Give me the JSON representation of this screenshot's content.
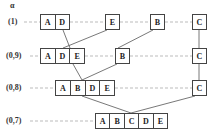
{
  "axis_label": "α",
  "levels": [
    {
      "label": "(1)",
      "groups": [
        [
          "A",
          "D"
        ],
        [
          "E"
        ],
        [
          "B"
        ],
        [
          "C"
        ]
      ]
    },
    {
      "label": "(0,9)",
      "groups": [
        [
          "A",
          "D",
          "E"
        ],
        [
          "B"
        ],
        [
          "C"
        ]
      ]
    },
    {
      "label": "(0,8)",
      "groups": [
        [
          "A",
          "B",
          "D",
          "E"
        ],
        [
          "C"
        ]
      ]
    },
    {
      "label": "(0,7)",
      "groups": [
        [
          "A",
          "B",
          "C",
          "D",
          "E"
        ]
      ]
    }
  ],
  "colors": {
    "line": "#444444",
    "dashed": "#aaaaaa",
    "text": "#222222"
  }
}
